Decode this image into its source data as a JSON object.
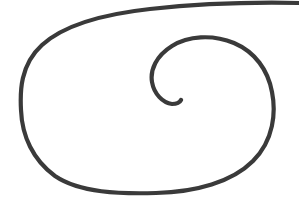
{
  "document": {
    "kind": "scanned-line-drawing",
    "title": "Hand-drawn spiral",
    "background_color": "#ffffff",
    "width": 299,
    "height": 212
  },
  "drawing": {
    "name": "spiral",
    "description": "A single continuous hand-drawn line forming a large rounded outer loop that spirals inward counter-clockwise to a small hook near the center",
    "stroke_color": "#3a3a3a",
    "stroke_width": 4.2,
    "stroke_width_tail": 2.0,
    "turns": 1.75,
    "start_point": [
      299,
      3
    ],
    "end_point": [
      168,
      102
    ],
    "extents": {
      "left": 20,
      "right": 276,
      "top": 2,
      "bottom": 194
    },
    "inner_hook": {
      "leftmost": [
        152,
        76
      ],
      "rightmost": [
        265,
        80
      ],
      "bottom": [
        176,
        104
      ]
    },
    "path": "M 299 3 C 250 2 196 4 150 9 C 104 14 64 25 42 45 C 20 65 20 92 21 110 C 22 136 33 160 55 176 C 80 193 120 194 156 193 C 196 192 232 182 253 161 C 274 140 276 112 272 92 C 268 70 255 52 234 43 C 212 34 188 36 172 46 C 156 56 150 70 152 82 C 154 94 163 103 172 104 C 177 104 180 102 181 100"
  },
  "artifacts": {
    "top_edge_line": {
      "name": "stroke-exit-top-edge",
      "y": 3,
      "from_x": 150,
      "to_x": 299,
      "note": "outer stroke tapers as it runs off the top-right edge"
    }
  }
}
